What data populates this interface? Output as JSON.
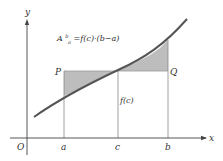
{
  "diagram": {
    "formula": {
      "lhs_base": "A",
      "lhs_sup": "b",
      "lhs_sub": "a",
      "rhs": "=f(c)·(b−a)"
    },
    "axes": {
      "x_label": "x",
      "y_label": "y",
      "origin_label": "O"
    },
    "x_ticks": [
      "a",
      "c",
      "b"
    ],
    "points": {
      "P": "P",
      "Q": "Q"
    },
    "height_label": "f(c)",
    "colors": {
      "curve": "#555555",
      "shade": "#bdbdbd",
      "axis": "#444444",
      "line": "#888888"
    }
  }
}
